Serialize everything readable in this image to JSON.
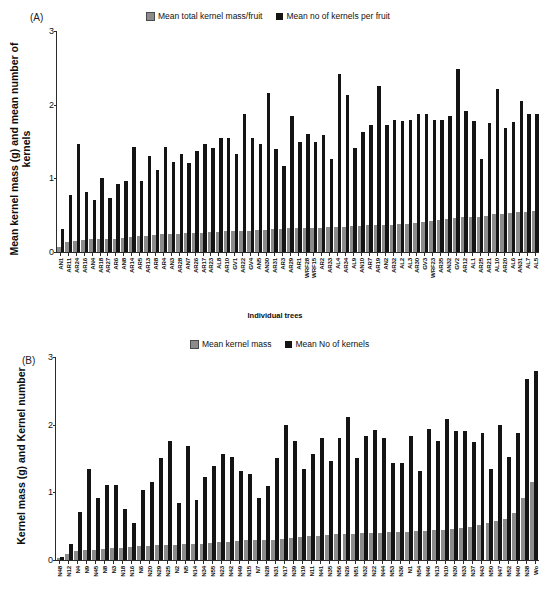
{
  "figure": {
    "panel_a_tag": "(A)",
    "panel_b_tag": "(B)"
  },
  "panel_a": {
    "legend": [
      {
        "label": "Mean total kernel mass/fruit",
        "color": "#8c8c8c"
      },
      {
        "label": "Mean no of kernels per fruit",
        "color": "#141414"
      }
    ],
    "ylabel": "Mean kernel mass (g) and mean number of\nkernels",
    "xlabel": "Individual trees",
    "yticks": [
      "0",
      "1",
      "2",
      "3"
    ]
  },
  "panel_b": {
    "legend": [
      {
        "label": "Mean kernel mass",
        "color": "#8c8c8c"
      },
      {
        "label": "Mean No of kernels",
        "color": "#141414"
      }
    ],
    "ylabel": "Kernel mass (g) and Kernel number",
    "xlabel": "",
    "yticks": [
      "0",
      "1",
      "2",
      "3"
    ]
  },
  "chart_data": [
    {
      "type": "bar",
      "panel": "A",
      "title": "",
      "xlabel": "Individual trees",
      "ylabel": "Mean kernel mass (g) and mean number of kernels",
      "ylim": [
        0,
        3
      ],
      "yticks": [
        0,
        1,
        2,
        3
      ],
      "grid": false,
      "legend_position": "top",
      "categories": [
        "AN1",
        "AR11",
        "AR24",
        "AR16",
        "AN4",
        "AR18",
        "AR27",
        "AR6",
        "AN8",
        "AR14",
        "AR5",
        "AR13",
        "AR8",
        "AR4",
        "AN3",
        "AR28",
        "AN7",
        "AR26",
        "AR17",
        "AR23",
        "AL8",
        "AR10",
        "GV1",
        "AR22",
        "GV4",
        "AN5",
        "AN30",
        "AR31",
        "AR3",
        "AR29",
        "AR1",
        "WRF28",
        "WRF15",
        "AR2",
        "AR33",
        "AL4",
        "AR34",
        "AL9",
        "AN10",
        "AR7",
        "AR19",
        "AN2",
        "AR32",
        "AL2",
        "AL3",
        "AR30",
        "GV3",
        "WRF23",
        "AR35",
        "AN32",
        "GV2",
        "AR12",
        "AL1",
        "AR25",
        "AR21",
        "AL10",
        "AR20",
        "AL6",
        "AN31",
        "AL7",
        "AL5"
      ],
      "series": [
        {
          "name": "Mean total kernel mass/fruit",
          "color": "#8c8c8c",
          "values": [
            0.07,
            0.13,
            0.15,
            0.16,
            0.17,
            0.17,
            0.18,
            0.18,
            0.19,
            0.21,
            0.22,
            0.22,
            0.23,
            0.24,
            0.25,
            0.25,
            0.26,
            0.26,
            0.26,
            0.27,
            0.27,
            0.28,
            0.28,
            0.29,
            0.29,
            0.3,
            0.3,
            0.31,
            0.31,
            0.32,
            0.32,
            0.33,
            0.33,
            0.33,
            0.34,
            0.34,
            0.34,
            0.35,
            0.35,
            0.36,
            0.36,
            0.37,
            0.37,
            0.38,
            0.38,
            0.39,
            0.41,
            0.42,
            0.44,
            0.45,
            0.46,
            0.47,
            0.47,
            0.48,
            0.49,
            0.51,
            0.52,
            0.53,
            0.54,
            0.54,
            0.55
          ]
        },
        {
          "name": "Mean no of kernels per fruit",
          "color": "#141414",
          "values": [
            0.31,
            0.78,
            1.47,
            0.82,
            0.7,
            1.0,
            0.74,
            0.92,
            0.96,
            1.42,
            0.96,
            1.3,
            1.12,
            1.42,
            1.22,
            1.33,
            1.21,
            1.37,
            1.46,
            1.41,
            1.55,
            1.55,
            1.33,
            1.88,
            1.55,
            1.46,
            2.16,
            1.4,
            1.17,
            1.84,
            1.49,
            1.6,
            1.5,
            1.59,
            1.26,
            2.41,
            2.13,
            1.41,
            1.63,
            1.73,
            2.25,
            1.72,
            1.79,
            1.78,
            1.79,
            1.87,
            1.87,
            1.79,
            1.79,
            1.84,
            2.49,
            1.91,
            1.78,
            1.26,
            1.75,
            2.21,
            1.68,
            1.77,
            2.05,
            1.88,
            1.88
          ]
        }
      ]
    },
    {
      "type": "bar",
      "panel": "B",
      "title": "",
      "xlabel": "",
      "ylabel": "Kernel mass (g) and Kernel number",
      "ylim": [
        0,
        3
      ],
      "yticks": [
        0,
        1,
        2,
        3
      ],
      "grid": false,
      "legend_position": "top",
      "categories": [
        "N48",
        "N12",
        "N4",
        "N9",
        "N45",
        "N8",
        "N3",
        "N18",
        "N16",
        "N6",
        "N20",
        "N29",
        "N25",
        "N2",
        "N5",
        "N14",
        "N34",
        "N55",
        "N23",
        "N42",
        "N49",
        "N15",
        "N7",
        "N28",
        "N31",
        "N17",
        "N39",
        "N19",
        "N11",
        "N41",
        "N35",
        "N56",
        "N26",
        "N51",
        "N32",
        "N22",
        "N44",
        "N53",
        "N36",
        "N1",
        "N54",
        "N46",
        "N13",
        "N10",
        "N30",
        "N33",
        "N37",
        "N43",
        "N50",
        "N47",
        "N52",
        "N40",
        "N38",
        "Wo"
      ],
      "series": [
        {
          "name": "Mean kernel mass",
          "color": "#8c8c8c",
          "values": [
            0.03,
            0.09,
            0.14,
            0.15,
            0.15,
            0.17,
            0.18,
            0.18,
            0.19,
            0.2,
            0.2,
            0.22,
            0.22,
            0.22,
            0.23,
            0.23,
            0.24,
            0.25,
            0.26,
            0.26,
            0.28,
            0.29,
            0.29,
            0.3,
            0.3,
            0.31,
            0.32,
            0.34,
            0.35,
            0.36,
            0.37,
            0.38,
            0.38,
            0.39,
            0.4,
            0.4,
            0.4,
            0.41,
            0.41,
            0.42,
            0.43,
            0.43,
            0.44,
            0.44,
            0.46,
            0.48,
            0.49,
            0.52,
            0.55,
            0.57,
            0.61,
            0.7,
            0.92,
            1.15
          ]
        },
        {
          "name": "Mean No of kernels",
          "color": "#141414",
          "values": [
            0.04,
            0.24,
            0.71,
            1.34,
            0.91,
            1.11,
            1.11,
            0.76,
            0.55,
            1.04,
            1.16,
            1.51,
            1.76,
            0.84,
            1.68,
            0.88,
            1.22,
            1.39,
            1.56,
            1.52,
            1.31,
            1.27,
            0.92,
            1.09,
            1.51,
            2.0,
            1.76,
            1.34,
            1.56,
            1.8,
            1.47,
            1.8,
            2.12,
            1.51,
            1.84,
            1.92,
            1.8,
            1.43,
            1.43,
            1.84,
            1.31,
            1.93,
            1.76,
            2.08,
            1.91,
            1.91,
            1.75,
            1.88,
            1.35,
            2.0,
            1.52,
            1.88,
            2.67,
            2.8
          ]
        }
      ]
    }
  ]
}
